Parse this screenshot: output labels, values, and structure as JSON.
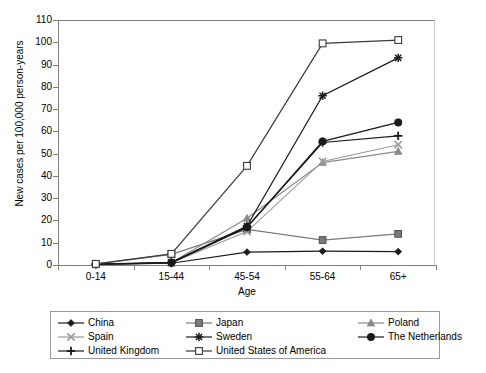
{
  "chart_data": {
    "type": "line",
    "title": "",
    "xlabel": "Age",
    "ylabel": "New cases per 100,000 person-years",
    "categories": [
      "0-14",
      "15-44",
      "45-54",
      "55-64",
      "65+"
    ],
    "ylim": [
      0,
      110
    ],
    "yticks": [
      0,
      10,
      20,
      30,
      40,
      50,
      60,
      70,
      80,
      90,
      100,
      110
    ],
    "grid": false,
    "legend_position": "bottom",
    "series": [
      {
        "name": "China",
        "marker": "diamond",
        "color": "#1a1a1a",
        "values": [
          0.3,
          0.8,
          5.8,
          6.2,
          6.0
        ]
      },
      {
        "name": "Japan",
        "marker": "square",
        "color": "#7a7a7a",
        "values": [
          0.4,
          4.8,
          16.0,
          11.2,
          14.0
        ]
      },
      {
        "name": "Poland",
        "marker": "triangle",
        "color": "#8a8a8a",
        "values": [
          0.3,
          1.0,
          21.0,
          46.0,
          51.0
        ]
      },
      {
        "name": "Spain",
        "marker": "cross-x",
        "color": "#9a9a9a",
        "values": [
          0.3,
          1.0,
          15.0,
          46.5,
          54.0
        ]
      },
      {
        "name": "Sweden",
        "marker": "asterisk",
        "color": "#1a1a1a",
        "values": [
          0.4,
          1.2,
          17.5,
          76.0,
          93.0
        ]
      },
      {
        "name": "The Netherlands",
        "marker": "circle",
        "color": "#1a1a1a",
        "values": [
          0.4,
          1.0,
          17.0,
          55.5,
          64.0
        ]
      },
      {
        "name": "United Kingdom",
        "marker": "plus",
        "color": "#1a1a1a",
        "values": [
          0.3,
          0.9,
          17.0,
          55.0,
          58.0
        ]
      },
      {
        "name": "United States of America",
        "marker": "open-square",
        "color": "#3a3a3a",
        "values": [
          0.5,
          5.0,
          44.5,
          99.5,
          101.0
        ]
      }
    ]
  },
  "legend": {
    "rows": [
      [
        "China",
        "Japan",
        "Poland"
      ],
      [
        "Spain",
        "Sweden",
        "The Netherlands"
      ],
      [
        "United Kingdom",
        "United States of America",
        ""
      ]
    ]
  }
}
